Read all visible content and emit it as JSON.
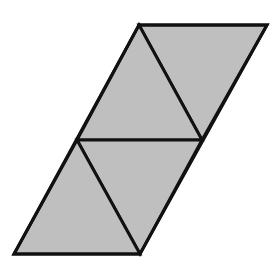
{
  "diagram": {
    "type": "parallelogram-net",
    "fill_color": "#bfbfbf",
    "stroke_color": "#111111",
    "background": "#ffffff",
    "vertices": {
      "top_left": [
        139,
        25
      ],
      "top_right": [
        267,
        25
      ],
      "mid_left": [
        77,
        140
      ],
      "mid_right": [
        202,
        140
      ],
      "bottom_left": [
        14,
        254
      ],
      "bottom_right": [
        140,
        254
      ]
    },
    "triangles": [
      {
        "name": "top-right-triangle",
        "points": "139,25 267,25 202,140"
      },
      {
        "name": "top-left-triangle",
        "points": "139,25 202,140 77,140"
      },
      {
        "name": "bottom-right-triangle",
        "points": "77,140 202,140 140,254"
      },
      {
        "name": "bottom-left-triangle",
        "points": "77,140 140,254 14,254"
      }
    ]
  }
}
